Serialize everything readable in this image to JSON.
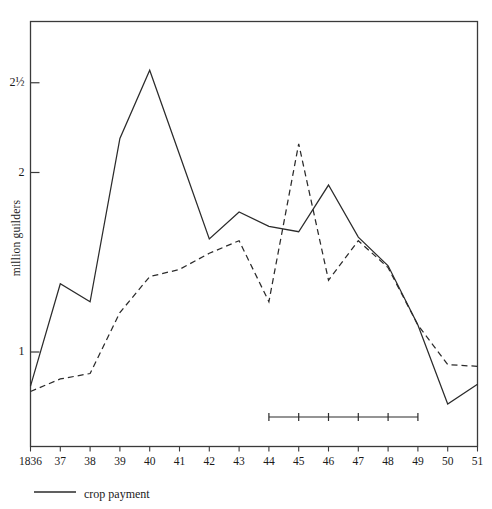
{
  "meta": {
    "clipped_title": "",
    "y_axis_title": "million guilders"
  },
  "legend": {
    "entries": [
      {
        "label": "crop payment",
        "style": "solid"
      }
    ]
  },
  "axes": {
    "y_ticks": [
      {
        "label": "2½",
        "value": 2.5
      },
      {
        "label": "2",
        "value": 2.0
      },
      {
        "label": "1",
        "value": 1.0
      }
    ],
    "x_ticks": [
      "1836",
      "37",
      "38",
      "39",
      "40",
      "41",
      "42",
      "43",
      "44",
      "45",
      "46",
      "47",
      "48",
      "49",
      "50",
      "51"
    ]
  },
  "range_bar": {
    "from": "44",
    "to": "49",
    "tick_count": 6,
    "ticks": [
      "44",
      "45",
      "46",
      "47",
      "48",
      "49"
    ]
  },
  "chart_data": {
    "type": "line",
    "title": "",
    "xlabel": "",
    "ylabel": "million guilders",
    "x": [
      1836,
      1837,
      1838,
      1839,
      1840,
      1841,
      1842,
      1843,
      1844,
      1845,
      1846,
      1847,
      1848,
      1849,
      1850,
      1851
    ],
    "xtick_labels": [
      "1836",
      "37",
      "38",
      "39",
      "40",
      "41",
      "42",
      "43",
      "44",
      "45",
      "46",
      "47",
      "48",
      "49",
      "50",
      "51"
    ],
    "ylim": [
      0.5,
      2.75
    ],
    "ytick_values": [
      1.0,
      2.0,
      2.5
    ],
    "ytick_labels": [
      "1",
      "2",
      "2½"
    ],
    "grid": false,
    "legend_position": "below-axes-left",
    "series": [
      {
        "name": "crop payment",
        "style": "solid",
        "color": "#2b2b2b",
        "values": [
          0.81,
          1.38,
          1.28,
          2.19,
          2.57,
          2.1,
          1.63,
          1.78,
          1.7,
          1.67,
          1.93,
          1.64,
          1.48,
          1.15,
          0.71,
          0.82
        ]
      },
      {
        "name": "unnamed dashed series",
        "style": "dashed",
        "color": "#2b2b2b",
        "values": [
          0.78,
          0.85,
          0.88,
          1.22,
          1.42,
          1.46,
          1.55,
          1.62,
          1.28,
          2.16,
          1.4,
          1.62,
          1.47,
          1.15,
          0.93,
          0.92
        ]
      }
    ]
  }
}
